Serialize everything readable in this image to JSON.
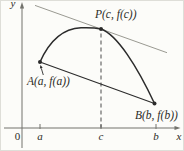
{
  "figure_labels": {
    "point_P": "P(c, f(c))",
    "point_A": "A(a, f(a))",
    "point_B": "B(b, f(b))"
  },
  "colors": {
    "ink": "#2b2b2b",
    "tangent": "#9a9a92",
    "axis": "#73736d",
    "dash": "#4a4a4a",
    "text": "#2b2b26",
    "background": "#fcfcf9",
    "border": "#deded8"
  },
  "axes": {
    "y_label": "y",
    "x_label": "x",
    "origin_label": "0",
    "x_axis": {
      "y": 128,
      "x1": 4,
      "x2": 175.5
    },
    "y_axis": {
      "x": 22,
      "y1": 8,
      "y2": 148
    },
    "ticks": [
      {
        "label": "a",
        "x": 40
      },
      {
        "label": "c",
        "x": 101
      },
      {
        "label": "b",
        "x": 156
      }
    ]
  },
  "curve": {
    "path": "M 40 62 C 49 42, 63 28.5, 81 27.8 C 89 27.5, 96 27.9, 101 29 C 117 34.7, 137 66, 154.5 103.5"
  },
  "secant_line": {
    "x1": 40,
    "y1": 62,
    "x2": 154.5,
    "y2": 103.5
  },
  "tangent_line": {
    "x1": 35,
    "y1": 5.4,
    "x2": 167,
    "y2": 52.7
  },
  "dashed_line": {
    "x": 101,
    "y1": 33.5,
    "y2": 127.5
  },
  "points": {
    "A": {
      "x": 40,
      "y": 62,
      "label_x": 27,
      "label_y": 84.5
    },
    "P": {
      "x": 101,
      "y": 29,
      "label_x": 95,
      "label_y": 18
    },
    "B": {
      "x": 154.5,
      "y": 103.5,
      "label_x": 135,
      "label_y": 119
    }
  },
  "annotation_arrow": {
    "x1": 43.3,
    "y1": 75,
    "x2": 41.3,
    "y2": 68.3
  }
}
